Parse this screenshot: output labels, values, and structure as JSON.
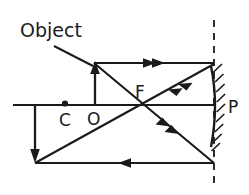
{
  "figure": {
    "kind": "optics-ray-diagram",
    "background_color": "#ffffff",
    "ink_color": "#1a1a1a"
  },
  "labels": {
    "object": "Object",
    "centre_of_curvature": "C",
    "optical_centre": "O",
    "focal_point": "F",
    "pole": "P"
  },
  "geometry": {
    "canvas": {
      "width": 249,
      "height": 195
    },
    "principal_axis": {
      "x1": 13,
      "y1": 105,
      "x2": 214,
      "y2": 105
    },
    "mirror": {
      "type": "concave",
      "vertex": {
        "x": 216,
        "y": 105
      },
      "top": {
        "x": 211,
        "y": 66
      },
      "bottom": {
        "x": 211,
        "y": 146
      }
    },
    "dashed_normal_line": {
      "x": 214,
      "y1": 20,
      "y2": 186
    },
    "points": {
      "C": {
        "x": 65,
        "y": 104
      },
      "O": {
        "x": 95,
        "y": 105
      },
      "F": {
        "x": 142,
        "y": 104
      },
      "P": {
        "x": 214,
        "y": 105
      }
    },
    "object_arrow": {
      "x": 95,
      "y_base": 105,
      "y_tip": 62
    },
    "image_arrow": {
      "x": 35,
      "y_base": 105,
      "y_tip": 162
    },
    "pointer_line": {
      "x1": 54,
      "y1": 47,
      "x2": 93,
      "y2": 66
    }
  },
  "rays": [
    {
      "name": "incident-parallel-ray",
      "from": {
        "x": 95,
        "y": 63
      },
      "to": {
        "x": 214,
        "y": 63
      },
      "marker": "double-chevron-right"
    },
    {
      "name": "reflected-ray-through-focus",
      "from": {
        "x": 214,
        "y": 64
      },
      "to": {
        "x": 142,
        "y": 104
      },
      "marker": "double-chevron-left"
    },
    {
      "name": "incident-ray-through-focus",
      "from": {
        "x": 95,
        "y": 63
      },
      "to": {
        "x": 214,
        "y": 163
      },
      "marker": "double-chevron-down-right"
    },
    {
      "name": "reflected-parallel-ray",
      "from": {
        "x": 214,
        "y": 163
      },
      "to": {
        "x": 35,
        "y": 163
      },
      "marker": "single-arrow-left"
    },
    {
      "name": "image-forming-ray",
      "from": {
        "x": 35,
        "y": 163
      },
      "to": {
        "x": 214,
        "y": 63
      },
      "marker": "none"
    }
  ],
  "label_positions": {
    "object": {
      "x": 20,
      "y": 36
    },
    "C": {
      "x": 59,
      "y": 124
    },
    "O": {
      "x": 88,
      "y": 123
    },
    "F": {
      "x": 136,
      "y": 97
    },
    "P": {
      "x": 226,
      "y": 112
    }
  }
}
